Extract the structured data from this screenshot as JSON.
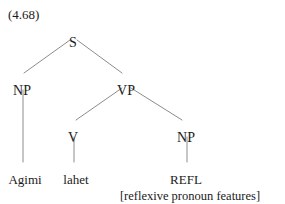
{
  "figure": {
    "example_number": "(4.68)",
    "background_color": "#ffffff",
    "text_color": "#1a1a1a",
    "branch_color": "#8c8c8c"
  },
  "tree": {
    "nodes": {
      "s": {
        "label": "S",
        "x": 73,
        "y": 36
      },
      "np_subject": {
        "label": "NP",
        "x": 22,
        "y": 84
      },
      "vp": {
        "label": "VP",
        "x": 126,
        "y": 84
      },
      "v": {
        "label": "V",
        "x": 73,
        "y": 131
      },
      "np_object": {
        "label": "NP",
        "x": 186,
        "y": 131
      }
    },
    "leaves": {
      "subject": {
        "label": "Agimi",
        "x": 25,
        "y": 173
      },
      "verb": {
        "label": "lahet",
        "x": 76,
        "y": 173
      },
      "object": {
        "label": "REFL",
        "x": 186,
        "y": 173
      }
    },
    "annotation": {
      "label": "[reflexive pronoun features]",
      "x": 190,
      "y": 190
    },
    "branches": [
      {
        "name": "s-to-np-subject",
        "x1": 70,
        "y1": 40,
        "x2": 24,
        "y2": 73
      },
      {
        "name": "s-to-vp",
        "x1": 77,
        "y1": 40,
        "x2": 122,
        "y2": 73
      },
      {
        "name": "vp-to-v",
        "x1": 122,
        "y1": 88,
        "x2": 76,
        "y2": 120
      },
      {
        "name": "vp-to-np-object",
        "x1": 131,
        "y1": 88,
        "x2": 182,
        "y2": 120
      },
      {
        "name": "np-subject-to-agimi",
        "x1": 23,
        "y1": 90,
        "x2": 23,
        "y2": 162
      },
      {
        "name": "v-to-lahet",
        "x1": 74,
        "y1": 137,
        "x2": 74,
        "y2": 162
      },
      {
        "name": "np-object-to-refl",
        "x1": 187,
        "y1": 137,
        "x2": 187,
        "y2": 162
      }
    ]
  }
}
